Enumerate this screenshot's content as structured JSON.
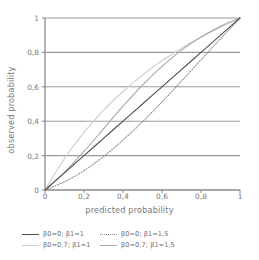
{
  "chart_data": {
    "type": "line",
    "title": "",
    "xlabel": "predicted probability",
    "ylabel": "observed probability",
    "xlim": [
      0,
      1
    ],
    "ylim": [
      0,
      1
    ],
    "xticks": [
      "0",
      "0,2",
      "0,4",
      "0,6",
      "0,8",
      "1"
    ],
    "xtick_values": [
      0,
      0.2,
      0.4,
      0.6,
      0.8,
      1
    ],
    "yticks": [
      "0",
      "0,2",
      "0,4",
      "0,6",
      "0,8",
      "1"
    ],
    "ytick_values": [
      0,
      0.2,
      0.4,
      0.6,
      0.8,
      1
    ],
    "grid": "horizontal",
    "gridlines_y": [
      0.2,
      0.4,
      0.6,
      0.8,
      1
    ],
    "legend_position": "below",
    "common_point": [
      0.2,
      0.2
    ],
    "series": [
      {
        "name": "β0=0;   β1=1",
        "beta0": 0,
        "beta1": 1,
        "style": "solid",
        "color": "#4d4d4d",
        "width": 1.1,
        "x": [
          0,
          0.1,
          0.2,
          0.3,
          0.4,
          0.5,
          0.6,
          0.7,
          0.8,
          0.9,
          1
        ],
        "y": [
          0,
          0.1,
          0.2,
          0.3,
          0.4,
          0.5,
          0.6,
          0.7,
          0.8,
          0.9,
          1
        ]
      },
      {
        "name": "β0=0;   β1=1,5",
        "beta0": 0,
        "beta1": 1.5,
        "style": "dotted",
        "color": "#8c8c8c",
        "width": 1.1,
        "x": [
          0,
          0.1,
          0.2,
          0.3,
          0.4,
          0.5,
          0.6,
          0.7,
          0.8,
          0.9,
          1
        ],
        "y": [
          0,
          0.048,
          0.113,
          0.194,
          0.29,
          0.397,
          0.512,
          0.633,
          0.757,
          0.879,
          1
        ]
      },
      {
        "name": "β0=0,7; β1=1",
        "beta0": 0.7,
        "beta1": 1,
        "style": "solid",
        "color": "#cfcfcf",
        "width": 1.2,
        "x": [
          0,
          0.1,
          0.2,
          0.3,
          0.4,
          0.5,
          0.6,
          0.7,
          0.8,
          0.9,
          1
        ],
        "y": [
          0,
          0.183,
          0.335,
          0.463,
          0.573,
          0.668,
          0.751,
          0.824,
          0.888,
          0.947,
          1
        ]
      },
      {
        "name": "β0=0,7; β1=1,5",
        "beta0": 0.7,
        "beta1": 1.5,
        "style": "solid",
        "color": "#a8a8a8",
        "width": 1.1,
        "x": [
          0,
          0.1,
          0.2,
          0.3,
          0.4,
          0.5,
          0.6,
          0.7,
          0.8,
          0.9,
          1
        ],
        "y": [
          0,
          0.103,
          0.224,
          0.356,
          0.487,
          0.61,
          0.719,
          0.813,
          0.889,
          0.952,
          1
        ]
      }
    ]
  },
  "legend": {
    "rows": [
      [
        {
          "label": "β0=0;   β1=1",
          "style": "solid",
          "color": "#4d4d4d"
        },
        {
          "label": "β0=0;   β1=1,5",
          "style": "dotted",
          "color": "#8c8c8c"
        }
      ],
      [
        {
          "label": "β0=0,7; β1=1",
          "style": "solid",
          "color": "#cfcfcf"
        },
        {
          "label": "β0=0,7; β1=1,5",
          "style": "solid",
          "color": "#a8a8a8"
        }
      ]
    ]
  },
  "colors": {
    "axis": "#8a8a8a",
    "grid": "#9a9a9a",
    "text": "#707070",
    "background": "#ffffff"
  }
}
